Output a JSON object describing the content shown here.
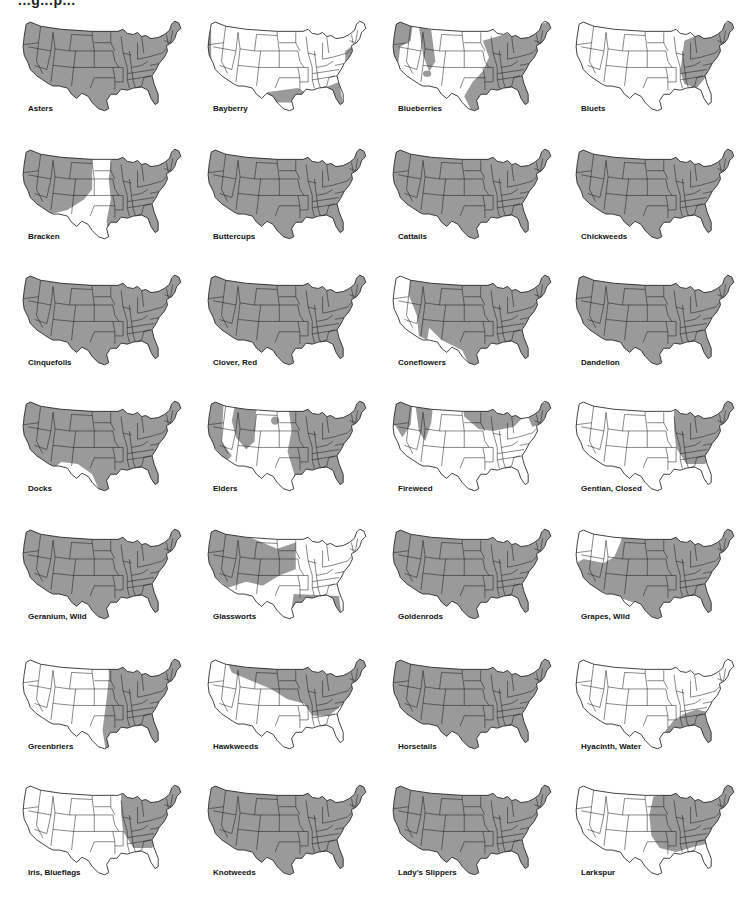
{
  "header": {
    "partial_title": "...g...p..."
  },
  "colors": {
    "range": "#9a9a9a",
    "outline": "#1a1a1a",
    "background": "#ffffff"
  },
  "maps": [
    {
      "label": "Asters",
      "coverage": "full"
    },
    {
      "label": "Bayberry",
      "coverage": "gulf-atlantic-pacific-coast"
    },
    {
      "label": "Blueberries",
      "coverage": "east-and-northwest-patches"
    },
    {
      "label": "Bluets",
      "coverage": "northeast-appalachian"
    },
    {
      "label": "Bracken",
      "coverage": "all-except-plains-and-southwest"
    },
    {
      "label": "Buttercups",
      "coverage": "full"
    },
    {
      "label": "Cattails",
      "coverage": "full"
    },
    {
      "label": "Chickweeds",
      "coverage": "full"
    },
    {
      "label": "Cinquefoils",
      "coverage": "full"
    },
    {
      "label": "Clover, Red",
      "coverage": "full"
    },
    {
      "label": "Coneflowers",
      "coverage": "east-and-central"
    },
    {
      "label": "Dandelion",
      "coverage": "full"
    },
    {
      "label": "Docks",
      "coverage": "north-and-east"
    },
    {
      "label": "Elders",
      "coverage": "west-coast-and-east-patches"
    },
    {
      "label": "Fireweed",
      "coverage": "north-and-mountains"
    },
    {
      "label": "Gentian, Closed",
      "coverage": "northeast"
    },
    {
      "label": "Geranium, Wild",
      "coverage": "full"
    },
    {
      "label": "Glassworts",
      "coverage": "west-interior-and-coasts"
    },
    {
      "label": "Goldenrods",
      "coverage": "full"
    },
    {
      "label": "Grapes, Wild",
      "coverage": "east-south-and-west-coast"
    },
    {
      "label": "Greenbriers",
      "coverage": "east"
    },
    {
      "label": "Hawkweeds",
      "coverage": "north-band-and-northeast"
    },
    {
      "label": "Horsetails",
      "coverage": "full"
    },
    {
      "label": "Hyacinth, Water",
      "coverage": "southeast"
    },
    {
      "label": "Iris, Blueflags",
      "coverage": "northeast"
    },
    {
      "label": "Knotweeds",
      "coverage": "full"
    },
    {
      "label": "Lady's Slippers",
      "coverage": "full"
    },
    {
      "label": "Larkspur",
      "coverage": "midwest-and-east"
    }
  ]
}
